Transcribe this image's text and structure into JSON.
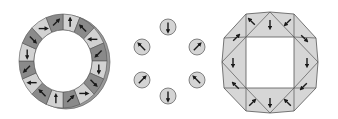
{
  "diagram": {
    "colors": {
      "dark_segment": "#8a8a8a",
      "light_segment": "#d2d2d2",
      "stroke": "#555555",
      "arrow": "#1a1a1a",
      "circle_fill": "#d4d4d4",
      "octagon_fill": "#d6d6d6"
    },
    "ring": {
      "label": "segmented-halbach-ring",
      "segments": 16,
      "center": [
        63,
        61
      ],
      "outer_radius": [
        44,
        47
      ],
      "inner_radius": [
        29,
        31
      ],
      "segment_shades": [
        "light",
        "dark",
        "light",
        "dark",
        "light",
        "dark",
        "light",
        "dark",
        "light",
        "dark",
        "light",
        "dark",
        "light",
        "dark",
        "light",
        "dark"
      ],
      "arrow_angles_deg": [
        90,
        135,
        180,
        225,
        270,
        315,
        0,
        45,
        90,
        135,
        180,
        225,
        270,
        315,
        0,
        45
      ]
    },
    "circles": {
      "label": "discrete-cylinder-magnets",
      "radius": 8,
      "items": [
        {
          "cx": 168,
          "cy": 27,
          "arrow_deg": 270
        },
        {
          "cx": 197,
          "cy": 47,
          "arrow_deg": 45
        },
        {
          "cx": 197,
          "cy": 80,
          "arrow_deg": 135
        },
        {
          "cx": 168,
          "cy": 96,
          "arrow_deg": 270
        },
        {
          "cx": 142,
          "cy": 80,
          "arrow_deg": 45
        },
        {
          "cx": 142,
          "cy": 47,
          "arrow_deg": 135
        }
      ]
    },
    "octagon": {
      "label": "triangular-segment-array",
      "outer": [
        [
          246,
          14
        ],
        [
          270,
          12
        ],
        [
          294,
          14
        ],
        [
          316,
          38
        ],
        [
          318,
          62
        ],
        [
          316,
          88
        ],
        [
          294,
          111
        ],
        [
          270,
          113
        ],
        [
          246,
          111
        ],
        [
          224,
          88
        ],
        [
          222,
          62
        ],
        [
          224,
          38
        ]
      ],
      "inner_square": [
        [
          246,
          37
        ],
        [
          294,
          37
        ],
        [
          294,
          88
        ],
        [
          246,
          88
        ]
      ]
    }
  }
}
